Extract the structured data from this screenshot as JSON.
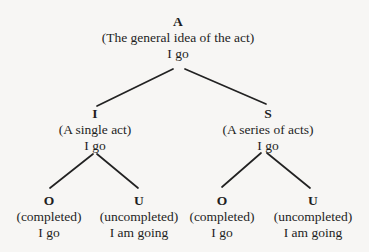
{
  "diagram": {
    "type": "tree",
    "nodes": {
      "root": {
        "key": "A",
        "desc": "(The general idea of the act)",
        "example": "I go"
      },
      "single": {
        "key": "I",
        "desc": "(A single act)",
        "example": "I go"
      },
      "series": {
        "key": "S",
        "desc": "(A series of acts)",
        "example": "I go"
      },
      "single_completed": {
        "key": "O",
        "desc": "(completed)",
        "example": "I go"
      },
      "single_uncompleted": {
        "key": "U",
        "desc": "(uncompleted)",
        "example": "I am going"
      },
      "series_completed": {
        "key": "O",
        "desc": "(completed)",
        "example": "I go"
      },
      "series_uncompleted": {
        "key": "U",
        "desc": "(uncompleted)",
        "example": "I am going"
      }
    },
    "edges": [
      [
        "root",
        "single"
      ],
      [
        "root",
        "series"
      ],
      [
        "single",
        "single_completed"
      ],
      [
        "single",
        "single_uncompleted"
      ],
      [
        "series",
        "series_completed"
      ],
      [
        "series",
        "series_uncompleted"
      ]
    ]
  }
}
